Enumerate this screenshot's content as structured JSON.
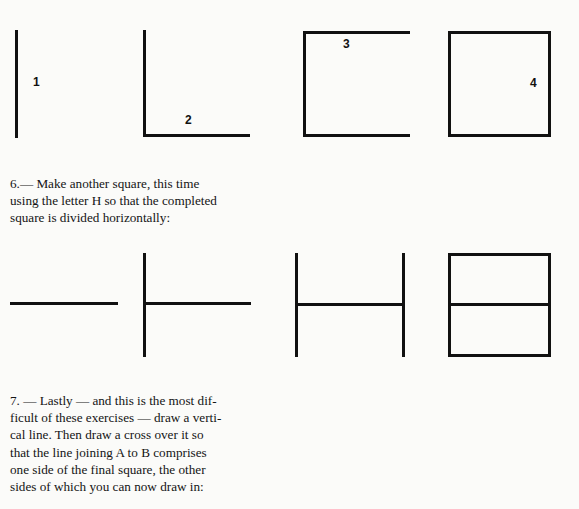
{
  "page": {
    "background_color": "#fbfbf9",
    "ink_color": "#111111"
  },
  "figure_rows": [
    {
      "name": "square-construction-row",
      "figures": [
        {
          "label": "1",
          "caption_name": "figure-label-1"
        },
        {
          "label": "2",
          "caption_name": "figure-label-2"
        },
        {
          "label": "3",
          "caption_name": "figure-label-3"
        },
        {
          "label": "4",
          "caption_name": "figure-label-4"
        }
      ]
    },
    {
      "name": "h-square-construction-row",
      "figures": [
        {
          "label": "",
          "caption_name": "figure-step-1"
        },
        {
          "label": "",
          "caption_name": "figure-step-2"
        },
        {
          "label": "",
          "caption_name": "figure-step-3"
        },
        {
          "label": "",
          "caption_name": "figure-step-4"
        }
      ]
    }
  ],
  "instructions": {
    "item6": {
      "number": "6.",
      "dash": "—",
      "line1": "Make  another  square,  this  time",
      "line2": "using  the letter H so that  the completed",
      "line3": "square is divided horizontally:",
      "full_text": "6. — Make another square, this time using the letter H so that the completed square is divided horizontally:"
    },
    "item7": {
      "number": "7.",
      "dash": "—",
      "line1": "Lastly — and  this  is  the  most  dif-",
      "line2": "ficult of these exercises — draw a verti-",
      "line3": "cal line.   Then  draw  a  cross  over  it  so",
      "line4": "that  the line joining A to B comprises",
      "line5": "one side of the final square, the other",
      "line6": "sides of which you can now draw in:",
      "full_text": "7. — Lastly — and this is the most difficult of these exercises — draw a vertical line. Then draw a cross over it so that the line joining A to B comprises one side of the final square, the other sides of which you can now draw in:"
    }
  }
}
